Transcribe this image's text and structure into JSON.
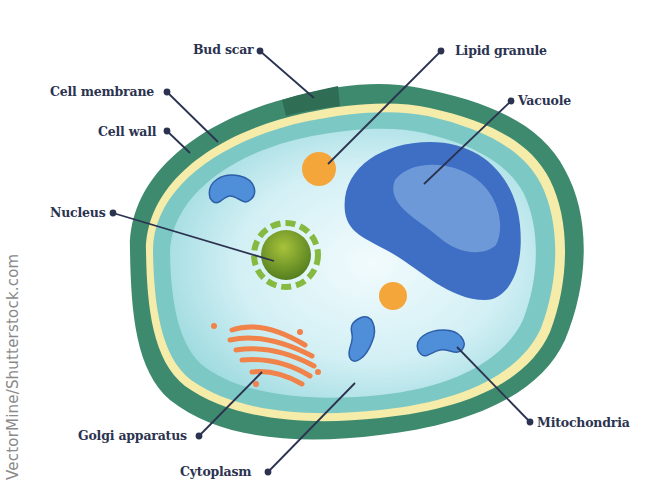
{
  "diagram": {
    "labels": {
      "bud_scar": "Bud scar",
      "lipid_granule": "Lipid granule",
      "cell_membrane": "Cell membrane",
      "vacuole": "Vacuole",
      "cell_wall": "Cell wall",
      "nucleus": "Nucleus",
      "golgi_apparatus": "Golgi apparatus",
      "mitochondria": "Mitochondria",
      "cytoplasm": "Cytoplasm"
    },
    "credit": "VectorMine/Shutterstock.com",
    "colors": {
      "cell_wall": "#3e8a6e",
      "bud_scar": "#2f6e55",
      "cell_membrane": "#f5ecaa",
      "cytoplasm_outer": "#7cc8c4",
      "cytoplasm_inner": "#dff4f8",
      "vacuole": "#3f6fc4",
      "vacuole_light": "#7ea7e0",
      "nucleus": "#7a9a28",
      "nucleus_envelope": "#86b940",
      "lipid_granule": "#f5a63a",
      "mitochondria": "#4f8ed8",
      "golgi": "#f0824a",
      "label_text": "#2b3350",
      "leader_line": "#2b3350"
    }
  }
}
